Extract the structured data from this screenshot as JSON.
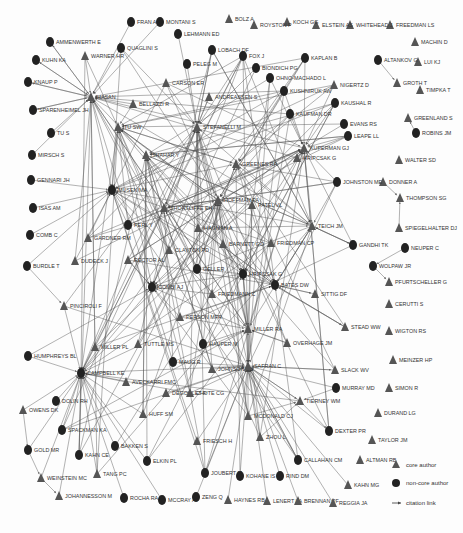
{
  "diagram": {
    "type": "citation-network",
    "legend": {
      "core": "core author",
      "noncore": "non-core author",
      "link": "citation link"
    },
    "nodes": [
      {
        "id": "AMMENWERTH E",
        "x": 50,
        "y": 42,
        "t": "n"
      },
      {
        "id": "KUHN KA",
        "x": 36,
        "y": 60,
        "t": "n"
      },
      {
        "id": "KNAUP P",
        "x": 28,
        "y": 82,
        "t": "n"
      },
      {
        "id": "SPARENHEIMEL JH",
        "x": 33,
        "y": 110,
        "t": "n"
      },
      {
        "id": "TU S",
        "x": 51,
        "y": 133,
        "t": "n"
      },
      {
        "id": "MIRSCH S",
        "x": 32,
        "y": 155,
        "t": "n"
      },
      {
        "id": "GENNARI JH",
        "x": 31,
        "y": 180,
        "t": "n"
      },
      {
        "id": "ISAS AM",
        "x": 33,
        "y": 208,
        "t": "n"
      },
      {
        "id": "COMB C",
        "x": 30,
        "y": 235,
        "t": "n"
      },
      {
        "id": "BURDLE T",
        "x": 27,
        "y": 266,
        "t": "n"
      },
      {
        "id": "HUMPHREYS BL",
        "x": 28,
        "y": 356,
        "t": "n"
      },
      {
        "id": "OWENS DK",
        "x": 23,
        "y": 410,
        "t": "c"
      },
      {
        "id": "DOLIN RH",
        "x": 56,
        "y": 401,
        "t": "n"
      },
      {
        "id": "SPACKMAN KA",
        "x": 62,
        "y": 430,
        "t": "n"
      },
      {
        "id": "GOLD MR",
        "x": 28,
        "y": 450,
        "t": "n"
      },
      {
        "id": "KAHN CE",
        "x": 79,
        "y": 455,
        "t": "n"
      },
      {
        "id": "WEINSTEIN MC",
        "x": 41,
        "y": 478,
        "t": "c"
      },
      {
        "id": "JOHANNESSON M",
        "x": 59,
        "y": 496,
        "t": "c"
      },
      {
        "id": "TANG PC",
        "x": 97,
        "y": 474,
        "t": "c"
      },
      {
        "id": "ROCHA RA",
        "x": 124,
        "y": 498,
        "t": "n"
      },
      {
        "id": "MCCRAY AT",
        "x": 162,
        "y": 500,
        "t": "n"
      },
      {
        "id": "ZENG Q",
        "x": 196,
        "y": 497,
        "t": "n"
      },
      {
        "id": "HAYNES RB",
        "x": 228,
        "y": 500,
        "t": "c"
      },
      {
        "id": "LENERT LA",
        "x": 267,
        "y": 501,
        "t": "c"
      },
      {
        "id": "BRENNAN PF",
        "x": 298,
        "y": 501,
        "t": "c"
      },
      {
        "id": "REGGIA JA",
        "x": 333,
        "y": 503,
        "t": "c"
      },
      {
        "id": "KAHN MG",
        "x": 348,
        "y": 485,
        "t": "c"
      },
      {
        "id": "ALTMAN RB",
        "x": 360,
        "y": 460,
        "t": "c"
      },
      {
        "id": "TAYLOR JM",
        "x": 372,
        "y": 440,
        "t": "c"
      },
      {
        "id": "DURAND LG",
        "x": 378,
        "y": 413,
        "t": "c"
      },
      {
        "id": "SIMON R",
        "x": 389,
        "y": 388,
        "t": "c"
      },
      {
        "id": "MEINZER HP",
        "x": 393,
        "y": 360,
        "t": "c"
      },
      {
        "id": "WIGTON RS",
        "x": 389,
        "y": 331,
        "t": "c"
      },
      {
        "id": "CERUTTI S",
        "x": 389,
        "y": 304,
        "t": "c"
      },
      {
        "id": "PFURTSCHELLER G",
        "x": 389,
        "y": 282,
        "t": "c"
      },
      {
        "id": "WOLPAW JR",
        "x": 373,
        "y": 266,
        "t": "n"
      },
      {
        "id": "NEUPER C",
        "x": 405,
        "y": 248,
        "t": "n"
      },
      {
        "id": "SPIEGELHALTER DJ",
        "x": 399,
        "y": 228,
        "t": "c"
      },
      {
        "id": "THOMPSON SG",
        "x": 400,
        "y": 198,
        "t": "c"
      },
      {
        "id": "DONNER A",
        "x": 383,
        "y": 182,
        "t": "c"
      },
      {
        "id": "WALTER SD",
        "x": 399,
        "y": 160,
        "t": "c"
      },
      {
        "id": "ROBINS JM",
        "x": 416,
        "y": 133,
        "t": "n"
      },
      {
        "id": "GREENLAND S",
        "x": 408,
        "y": 118,
        "t": "c"
      },
      {
        "id": "TIMPKA T",
        "x": 420,
        "y": 90,
        "t": "c"
      },
      {
        "id": "GROTH T",
        "x": 397,
        "y": 83,
        "t": "c"
      },
      {
        "id": "LUI KJ",
        "x": 418,
        "y": 62,
        "t": "c"
      },
      {
        "id": "ALTANKOV G",
        "x": 378,
        "y": 60,
        "t": "n"
      },
      {
        "id": "MACHIN D",
        "x": 415,
        "y": 42,
        "t": "c"
      },
      {
        "id": "FREEDMAN LS",
        "x": 390,
        "y": 25,
        "t": "c"
      },
      {
        "id": "WHITEHEAD J",
        "x": 350,
        "y": 25,
        "t": "c"
      },
      {
        "id": "ELSTEIN AS",
        "x": 316,
        "y": 25,
        "t": "c"
      },
      {
        "id": "KOCH GG",
        "x": 287,
        "y": 22,
        "t": "c"
      },
      {
        "id": "ROYSTON P",
        "x": 254,
        "y": 25,
        "t": "c"
      },
      {
        "id": "BOLZ A",
        "x": 229,
        "y": 19,
        "t": "c"
      },
      {
        "id": "FRAN A",
        "x": 131,
        "y": 22,
        "t": "n"
      },
      {
        "id": "MONTANI S",
        "x": 160,
        "y": 22,
        "t": "n"
      },
      {
        "id": "LEHMANN ED",
        "x": 178,
        "y": 34,
        "t": "n"
      },
      {
        "id": "QUAGLINI S",
        "x": 121,
        "y": 48,
        "t": "n"
      },
      {
        "id": "WARNER HR",
        "x": 85,
        "y": 56,
        "t": "c"
      },
      {
        "id": "LOBACH DF",
        "x": 212,
        "y": 50,
        "t": "n"
      },
      {
        "id": "FOX J",
        "x": 243,
        "y": 56,
        "t": "n"
      },
      {
        "id": "PELEG M",
        "x": 187,
        "y": 64,
        "t": "n"
      },
      {
        "id": "BIONDICH PG",
        "x": 256,
        "y": 68,
        "t": "n"
      },
      {
        "id": "CARSON ER",
        "x": 166,
        "y": 83,
        "t": "c"
      },
      {
        "id": "OHNO-MACHADO L",
        "x": 270,
        "y": 78,
        "t": "n"
      },
      {
        "id": "KAPLAN B",
        "x": 305,
        "y": 58,
        "t": "n"
      },
      {
        "id": "KUSHNIRUK AW",
        "x": 284,
        "y": 91,
        "t": "n"
      },
      {
        "id": "NIGERTZ D",
        "x": 334,
        "y": 85,
        "t": "c"
      },
      {
        "id": "HASAN",
        "x": 91,
        "y": 97,
        "t": "c"
      },
      {
        "id": "BELLAZZI R",
        "x": 133,
        "y": 104,
        "t": "c"
      },
      {
        "id": "ANDREASSEN S",
        "x": 209,
        "y": 97,
        "t": "c"
      },
      {
        "id": "KAUFMAN DR",
        "x": 290,
        "y": 114,
        "t": "n"
      },
      {
        "id": "KAUSHAL R",
        "x": 335,
        "y": 103,
        "t": "n"
      },
      {
        "id": "EVANS RS",
        "x": 344,
        "y": 124,
        "t": "n"
      },
      {
        "id": "LEAPE LL",
        "x": 348,
        "y": 136,
        "t": "n"
      },
      {
        "id": "TU SW",
        "x": 118,
        "y": 127,
        "t": "c"
      },
      {
        "id": "STEFANELLI M",
        "x": 197,
        "y": 127,
        "t": "c"
      },
      {
        "id": "SHAHAR Y",
        "x": 146,
        "y": 155,
        "t": "c"
      },
      {
        "id": "HRIPCSAK G (KUPERMAN GJ)",
        "x": 297,
        "y": 158,
        "t": "c"
      },
      {
        "id": "GREENES RA",
        "x": 236,
        "y": 164,
        "t": "c"
      },
      {
        "id": "MUSEN MA",
        "x": 112,
        "y": 190,
        "t": "n"
      },
      {
        "id": "JOHNSTON ME",
        "x": 337,
        "y": 182,
        "t": "n"
      },
      {
        "id": "SHORTLIFFE EH",
        "x": 164,
        "y": 208,
        "t": "c"
      },
      {
        "id": "KUPERMAN GJ",
        "x": 304,
        "y": 148,
        "t": "c"
      },
      {
        "id": "HOFFMAN PA",
        "x": 218,
        "y": 200,
        "t": "c"
      },
      {
        "id": "PATEL VL",
        "x": 252,
        "y": 205,
        "t": "c"
      },
      {
        "id": "PERL Y",
        "x": 128,
        "y": 225,
        "t": "n"
      },
      {
        "id": "HAGMAN A",
        "x": 198,
        "y": 228,
        "t": "c"
      },
      {
        "id": "TEICH JM",
        "x": 312,
        "y": 226,
        "t": "c"
      },
      {
        "id": "GARDNER RM",
        "x": 88,
        "y": 238,
        "t": "c"
      },
      {
        "id": "BARNETT GO",
        "x": 223,
        "y": 244,
        "t": "c"
      },
      {
        "id": "FRIEDMAN CP",
        "x": 271,
        "y": 243,
        "t": "c"
      },
      {
        "id": "RECTOR AL",
        "x": 128,
        "y": 260,
        "t": "c"
      },
      {
        "id": "CLAYTON PD",
        "x": 169,
        "y": 250,
        "t": "c"
      },
      {
        "id": "DUDECK J",
        "x": 75,
        "y": 261,
        "t": "c"
      },
      {
        "id": "GANDHI TK",
        "x": 353,
        "y": 245,
        "t": "n"
      },
      {
        "id": "GELLER",
        "x": 197,
        "y": 269,
        "t": "n"
      },
      {
        "id": "HRIPCSAK G",
        "x": 243,
        "y": 274,
        "t": "n"
      },
      {
        "id": "COMBI AJ",
        "x": 152,
        "y": 287,
        "t": "n"
      },
      {
        "id": "FRIEDMANN C",
        "x": 212,
        "y": 294,
        "t": "c"
      },
      {
        "id": "BATES DW",
        "x": 275,
        "y": 285,
        "t": "n"
      },
      {
        "id": "SITTIG DF",
        "x": 315,
        "y": 294,
        "t": "c"
      },
      {
        "id": "PINCIROLI F",
        "x": 64,
        "y": 306,
        "t": "c"
      },
      {
        "id": "PERSON MFR",
        "x": 180,
        "y": 317,
        "t": "c"
      },
      {
        "id": "MILLER RA",
        "x": 248,
        "y": 329,
        "t": "c"
      },
      {
        "id": "STEAD WW",
        "x": 345,
        "y": 327,
        "t": "c"
      },
      {
        "id": "MILLER PL",
        "x": 95,
        "y": 347,
        "t": "c"
      },
      {
        "id": "TUTTLE MS",
        "x": 138,
        "y": 344,
        "t": "c"
      },
      {
        "id": "HAUPER M",
        "x": 203,
        "y": 344,
        "t": "n"
      },
      {
        "id": "OVERHAGE JM",
        "x": 287,
        "y": 343,
        "t": "c"
      },
      {
        "id": "MAUG R",
        "x": 173,
        "y": 362,
        "t": "n"
      },
      {
        "id": "JOHNSON SB",
        "x": 212,
        "y": 369,
        "t": "c"
      },
      {
        "id": "SAFRAN C",
        "x": 248,
        "y": 366,
        "t": "c"
      },
      {
        "id": "SLACK WV",
        "x": 335,
        "y": 370,
        "t": "c"
      },
      {
        "id": "CAMPBELL KE",
        "x": 81,
        "y": 373,
        "t": "n"
      },
      {
        "id": "AVECKARRI FMC",
        "x": 126,
        "y": 382,
        "t": "c"
      },
      {
        "id": "DEGOULET P",
        "x": 166,
        "y": 393,
        "t": "c"
      },
      {
        "id": "CHUTE CG",
        "x": 190,
        "y": 393,
        "t": "c"
      },
      {
        "id": "TIERNEY WM",
        "x": 300,
        "y": 401,
        "t": "c"
      },
      {
        "id": "MURRAY MD",
        "x": 336,
        "y": 388,
        "t": "n"
      },
      {
        "id": "HUFF SM",
        "x": 143,
        "y": 414,
        "t": "c"
      },
      {
        "id": "MCDONALD CJ",
        "x": 248,
        "y": 416,
        "t": "c"
      },
      {
        "id": "ZHOU L",
        "x": 260,
        "y": 437,
        "t": "c"
      },
      {
        "id": "DEXTER PR",
        "x": 329,
        "y": 431,
        "t": "n"
      },
      {
        "id": "BAKKEN S",
        "x": 115,
        "y": 446,
        "t": "n"
      },
      {
        "id": "ELKIN PL",
        "x": 147,
        "y": 461,
        "t": "n"
      },
      {
        "id": "FRIESCH H",
        "x": 197,
        "y": 441,
        "t": "c"
      },
      {
        "id": "CALLAHAN CM",
        "x": 298,
        "y": 460,
        "t": "n"
      },
      {
        "id": "JOUBERT M",
        "x": 205,
        "y": 473,
        "t": "n"
      },
      {
        "id": "KOHANE IS",
        "x": 240,
        "y": 476,
        "t": "n"
      },
      {
        "id": "RIND DM",
        "x": 280,
        "y": 476,
        "t": "n"
      }
    ],
    "hubs": [
      "COMBI AJ",
      "MUSEN MA",
      "GREENES RA",
      "HRIPCSAK G",
      "BATES DW",
      "SHAHAR Y",
      "SHORTLIFFE EH",
      "HOFFMAN PA",
      "CAMPBELL KE",
      "SAFRAN C",
      "MILLER RA",
      "TEICH JM",
      "KUPERMAN GJ",
      "STEFANELLI M",
      "HASAN",
      "TU SW"
    ]
  }
}
